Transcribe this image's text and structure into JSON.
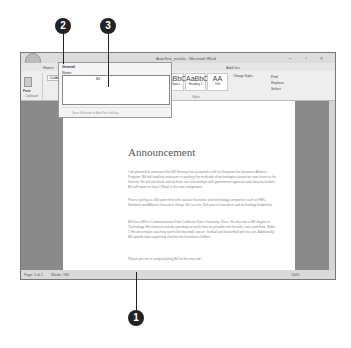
{
  "window": {
    "title": "AutoText_results - Microsoft Word",
    "controls": "– ▫ ×"
  },
  "tabs": [
    "Home",
    "Insert",
    "Page Layout",
    "Add-Ins"
  ],
  "ribbon": {
    "groups": [
      "Clipboard",
      "Font",
      "Styles",
      "Editing"
    ],
    "paste_label": "Paste",
    "font_value": "Calibri",
    "styles": [
      {
        "preview": "AaBbCcDc",
        "name": "¶ Normal"
      },
      {
        "preview": "AaBbCcDc",
        "name": "¶ No Spaci..."
      },
      {
        "preview": "AaBbC",
        "name": "Heading 1"
      },
      {
        "preview": "AA",
        "name": "Title"
      }
    ],
    "change_styles": "Change Styles",
    "editing": [
      "Find",
      "Replace",
      "Select"
    ]
  },
  "dropdown": {
    "header": "General",
    "name_label": "Name",
    "column_label": "Bill",
    "footer": "Save Selection to AutoText Gallery..."
  },
  "document": {
    "heading": "Announcement",
    "paragraphs": [
      "I am pleased to announce that Bill Kenney has accepted a role to champion the Insurance Alliance Program. Bill will lead key resources in pushing the multitude of technologies across we now invest in the Internet. He will also build and facilitate our relationships with government agencies and industry leaders. Bill will report to Gary O'Neal in this new assignment.",
      "Prior to joining us, Bill spent time with various Insurance and technology companies such as PMC, Solutions and Alliance Insurance Group. Bill is in his 15th year in insurance and technology leadership.",
      "Bill has a BS in Communications from California State University, Chico. He also has a MS degree in Technology. His interests include spending as much time as possible with his wife, sons and three. Babe. T. He also enjoys coaching sports like baseball, soccer, football and basketball with his son. Additionally, Bill spends time supporting charities for homeless children.",
      "Please join me in congratulating Bill on his new role!"
    ]
  },
  "status": {
    "page": "Page: 1 of 1",
    "words": "Words: 183",
    "zoom": "100%"
  },
  "callouts": [
    "1",
    "2",
    "3"
  ]
}
